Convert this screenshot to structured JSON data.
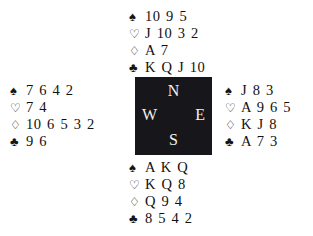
{
  "diagram": {
    "background_color": "#ffffff",
    "text_color": "#111111"
  },
  "suits": {
    "spade": {
      "name": "spade-icon",
      "glyph": "♠",
      "filled": true
    },
    "heart": {
      "name": "heart-icon",
      "glyph": "♡",
      "filled": false
    },
    "diamond": {
      "name": "diamond-icon",
      "glyph": "♢",
      "filled": false
    },
    "club": {
      "name": "club-icon",
      "glyph": "♣",
      "filled": true
    }
  },
  "compass": {
    "background_color": "#17161a",
    "letter_color": "#f2f1ef",
    "north": "N",
    "west": "W",
    "east": "E",
    "south": "S"
  },
  "hands": {
    "north": {
      "position": "North",
      "spades": "10 9 5",
      "hearts": "J 10 3 2",
      "diamonds": "A 7",
      "clubs": "K Q J 10"
    },
    "west": {
      "position": "West",
      "spades": "7 6 4 2",
      "hearts": "7 4",
      "diamonds": "10 6 5 3 2",
      "clubs": "9 6"
    },
    "east": {
      "position": "East",
      "spades": "J 8 3",
      "hearts": "A 9 6 5",
      "diamonds": "K J 8",
      "clubs": "A 7 3"
    },
    "south": {
      "position": "South",
      "spades": "A K Q",
      "hearts": "K Q 8",
      "diamonds": "Q 9 4",
      "clubs": "8 5 4 2"
    }
  }
}
